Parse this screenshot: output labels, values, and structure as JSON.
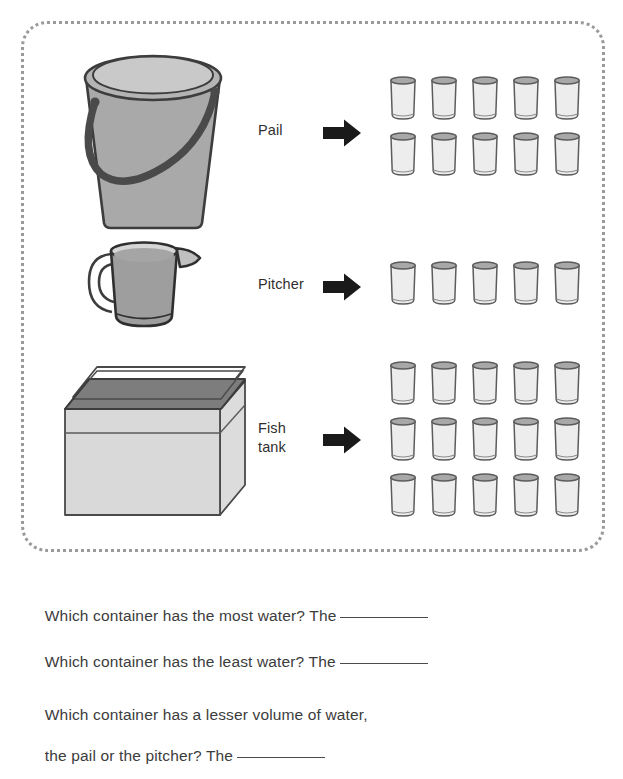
{
  "worksheet": {
    "frame": {
      "style": "dotted-rounded-border",
      "color": "#9a9a9a"
    },
    "rows": [
      {
        "id": "pail",
        "label": "Pail",
        "container_icon": "pail-illustration",
        "arrow_icon": "right-arrow-icon",
        "glass_icon": "glass-icon",
        "glass_count": 10,
        "glass_rows": 2,
        "glass_cols": 5
      },
      {
        "id": "pitcher",
        "label": "Pitcher",
        "container_icon": "pitcher-illustration",
        "arrow_icon": "right-arrow-icon",
        "glass_icon": "glass-icon",
        "glass_count": 5,
        "glass_rows": 1,
        "glass_cols": 5
      },
      {
        "id": "fish-tank",
        "label": "Fish\ntank",
        "label_line1": "Fish",
        "label_line2": "tank",
        "container_icon": "fish-tank-illustration",
        "arrow_icon": "right-arrow-icon",
        "glass_icon": "glass-icon",
        "glass_count": 15,
        "glass_rows": 3,
        "glass_cols": 5
      }
    ]
  },
  "questions": [
    {
      "id": "q1",
      "text": "Which container has the most water? The",
      "answer_blank": true,
      "answer_value": ""
    },
    {
      "id": "q2",
      "text": "Which container has the least water? The",
      "answer_blank": true,
      "answer_value": ""
    },
    {
      "id": "q3",
      "line1": "Which container has a lesser volume of water,",
      "line2": "the pail or the pitcher? The",
      "answer_blank": true,
      "answer_value": ""
    }
  ],
  "colors": {
    "frame_dots": "#9a9a9a",
    "text": "#3c3c3c",
    "arrow": "#1a1a1a",
    "pail_body": "#a8a8a8",
    "pail_outline": "#3d3d3d",
    "pitcher_body": "#9e9e9e",
    "tank_body": "#d8d8d8",
    "tank_rim": "#6e6e6e",
    "glass_fill": "#ededed",
    "glass_outline": "#5c5c5c",
    "glass_rim": "#8d8d8d"
  }
}
